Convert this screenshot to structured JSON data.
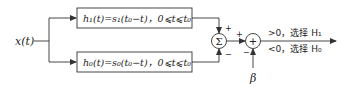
{
  "diagram": {
    "input": {
      "label": "x(t)"
    },
    "filters": [
      {
        "id": "h1",
        "label": "h₁(t)=s₁(t₀−t)，0⩽t⩽t₀"
      },
      {
        "id": "h0",
        "label": "h₀(t)=s₀(t₀−t)，0⩽t⩽t₀"
      }
    ],
    "summer": {
      "symbol": "Σ",
      "top_sign": "+",
      "bottom_sign": "−"
    },
    "adder": {
      "symbol": "+",
      "left_sign": "+",
      "bottom_sign": "−"
    },
    "threshold": {
      "label": "β"
    },
    "decision": {
      "upper": ">0，选择 H₁",
      "lower": "<0，选择 H₀"
    },
    "colors": {
      "stroke": "#333333",
      "text": "#222222",
      "background": "#ffffff"
    }
  }
}
